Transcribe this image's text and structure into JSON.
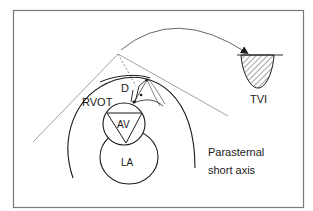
{
  "figure": {
    "labels": {
      "d": "D",
      "rvot": "RVOT",
      "av": "AV",
      "la": "LA",
      "tvi": "TVI",
      "view_line1": "Parasternal",
      "view_line2": "short axis"
    },
    "colors": {
      "stroke": "#1a1a1a",
      "beam": "#8a8a8a",
      "frame": "#7a7a7a",
      "background": "#ffffff"
    }
  }
}
